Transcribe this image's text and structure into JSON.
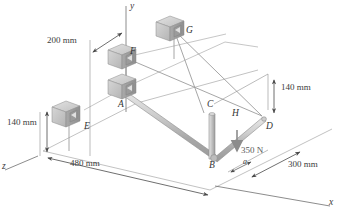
{
  "figure": {
    "background_color": "#ffffff",
    "line_color": "#9a9a9a",
    "pipe_color": "#b8b8b8",
    "bracket_color": "#c9c9c9",
    "text_color": "#3a3a3a"
  },
  "axes": [
    {
      "name": "y-axis",
      "label": "y"
    },
    {
      "name": "x-axis",
      "label": "x"
    },
    {
      "name": "z-axis",
      "label": "z"
    }
  ],
  "points": [
    {
      "id": "A",
      "label": "A"
    },
    {
      "id": "B",
      "label": "B"
    },
    {
      "id": "C",
      "label": "C"
    },
    {
      "id": "D",
      "label": "D"
    },
    {
      "id": "E",
      "label": "E"
    },
    {
      "id": "F",
      "label": "F"
    },
    {
      "id": "G",
      "label": "G"
    },
    {
      "id": "H",
      "label": "H"
    }
  ],
  "dimensions": [
    {
      "id": "dim-200",
      "label": "200 mm"
    },
    {
      "id": "dim-140-right",
      "label": "140 mm"
    },
    {
      "id": "dim-140-left",
      "label": "140 mm"
    },
    {
      "id": "dim-480",
      "label": "480 mm"
    },
    {
      "id": "dim-300",
      "label": "300 mm"
    },
    {
      "id": "dim-a",
      "label": "a"
    }
  ],
  "load": {
    "id": "applied-force",
    "label": "350 N",
    "direction": "downward"
  }
}
